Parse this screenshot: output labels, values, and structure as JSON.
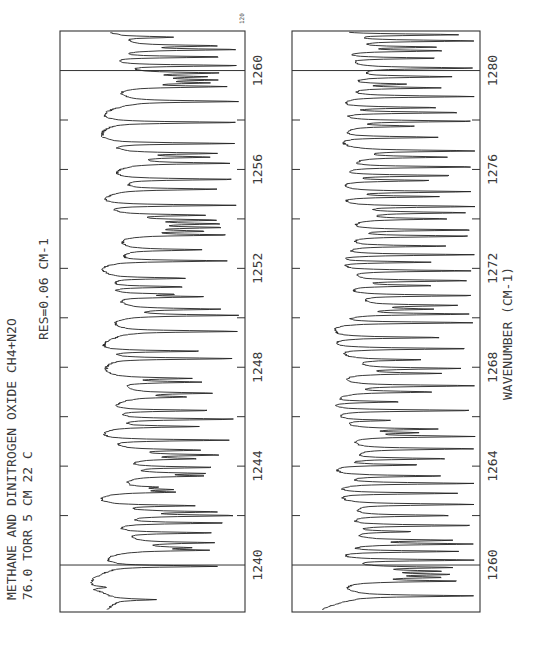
{
  "chart_data": {
    "type": "line",
    "orientation": "rotated-90-ccw",
    "title": "METHANE AND DINITROGEN OXIDE   CH4+N2O",
    "subtitle_lines": [
      "76.0  TORR   5 CM   22 C",
      "RES=0.06 CM-1"
    ],
    "top_right_label": "120",
    "xlabel": "WAVENUMBER (CM-1)",
    "ylabel": "Transmittance",
    "grid": false,
    "panels": [
      {
        "name": "panel-1",
        "xlim": [
          1238.1,
          1261.6
        ],
        "x_ticks": [
          1240,
          1244,
          1248,
          1252,
          1256,
          1260
        ],
        "minor_tick_step": 2,
        "full_lines_at": [
          1240,
          1260
        ],
        "baseline": 0.82,
        "lines": [
          [
            1238.6,
            0.55
          ],
          [
            1239.0,
            0.85
          ],
          [
            1239.1,
            0.75
          ],
          [
            1239.95,
            0.15
          ],
          [
            1240.6,
            0.25
          ],
          [
            1240.7,
            0.42
          ],
          [
            1240.9,
            0.22
          ],
          [
            1241.3,
            0.2
          ],
          [
            1241.7,
            0.1
          ],
          [
            1242.0,
            0.05
          ],
          [
            1242.15,
            0.18
          ],
          [
            1242.4,
            0.3
          ],
          [
            1242.95,
            0.45
          ],
          [
            1243.05,
            0.5
          ],
          [
            1243.15,
            0.6
          ],
          [
            1243.6,
            0.3
          ],
          [
            1243.7,
            0.28
          ],
          [
            1243.95,
            0.2
          ],
          [
            1244.3,
            0.35
          ],
          [
            1244.45,
            0.18
          ],
          [
            1244.65,
            0.3
          ],
          [
            1245.05,
            0.08
          ],
          [
            1245.6,
            0.28
          ],
          [
            1245.9,
            0.05
          ],
          [
            1246.25,
            0.2
          ],
          [
            1246.8,
            0.42
          ],
          [
            1246.95,
            0.22
          ],
          [
            1247.4,
            0.28
          ],
          [
            1247.55,
            0.34
          ],
          [
            1248.35,
            0.05
          ],
          [
            1248.65,
            0.24
          ],
          [
            1249.45,
            0.03
          ],
          [
            1250.1,
            0.03
          ],
          [
            1250.35,
            0.16
          ],
          [
            1250.85,
            0.25
          ],
          [
            1250.95,
            0.45
          ],
          [
            1251.25,
            0.35
          ],
          [
            1251.6,
            0.35
          ],
          [
            1252.3,
            0.1
          ],
          [
            1252.75,
            0.28
          ],
          [
            1253.35,
            0.1
          ],
          [
            1253.5,
            0.3
          ],
          [
            1253.65,
            0.16
          ],
          [
            1253.8,
            0.18
          ],
          [
            1253.95,
            0.2
          ],
          [
            1254.15,
            0.25
          ],
          [
            1254.55,
            0.04
          ],
          [
            1255.2,
            0.17
          ],
          [
            1255.6,
            0.05
          ],
          [
            1256.25,
            0.08
          ],
          [
            1256.5,
            0.25
          ],
          [
            1256.65,
            0.18
          ],
          [
            1257.05,
            0.05
          ],
          [
            1257.9,
            0.02
          ],
          [
            1258.75,
            0.02
          ],
          [
            1259.35,
            0.12
          ],
          [
            1259.5,
            0.28
          ],
          [
            1259.62,
            0.22
          ],
          [
            1259.75,
            0.3
          ],
          [
            1259.9,
            0.18
          ],
          [
            1260.2,
            0.02
          ],
          [
            1260.55,
            0.12
          ],
          [
            1260.85,
            0.03
          ],
          [
            1261.0,
            0.18
          ],
          [
            1261.35,
            0.45
          ]
        ]
      },
      {
        "name": "panel-2",
        "xlim": [
          1258.1,
          1281.6
        ],
        "x_ticks": [
          1260,
          1264,
          1268,
          1272,
          1276,
          1280
        ],
        "minor_tick_step": 2,
        "full_lines_at": [
          1260,
          1280
        ],
        "baseline": 0.86,
        "lines": [
          [
            1258.75,
            0.02
          ],
          [
            1259.35,
            0.12
          ],
          [
            1259.5,
            0.28
          ],
          [
            1259.62,
            0.22
          ],
          [
            1259.75,
            0.3
          ],
          [
            1259.9,
            0.18
          ],
          [
            1260.2,
            0.02
          ],
          [
            1260.55,
            0.12
          ],
          [
            1260.85,
            0.03
          ],
          [
            1261.0,
            0.18
          ],
          [
            1261.35,
            0.45
          ],
          [
            1261.6,
            0.02
          ],
          [
            1262.0,
            0.18
          ],
          [
            1262.45,
            0.02
          ],
          [
            1262.9,
            0.12
          ],
          [
            1263.3,
            0.02
          ],
          [
            1263.6,
            0.22
          ],
          [
            1264.05,
            0.35
          ],
          [
            1264.3,
            0.2
          ],
          [
            1264.7,
            0.02
          ],
          [
            1265.2,
            0.02
          ],
          [
            1265.35,
            0.45
          ],
          [
            1265.5,
            0.28
          ],
          [
            1265.85,
            0.55
          ],
          [
            1266.25,
            0.02
          ],
          [
            1266.6,
            0.45
          ],
          [
            1267.0,
            0.3
          ],
          [
            1267.25,
            0.02
          ],
          [
            1267.75,
            0.25
          ],
          [
            1267.95,
            0.12
          ],
          [
            1268.3,
            0.38
          ],
          [
            1268.75,
            0.04
          ],
          [
            1269.2,
            0.22
          ],
          [
            1269.8,
            0.03
          ],
          [
            1270.15,
            0.06
          ],
          [
            1270.35,
            0.35
          ],
          [
            1270.5,
            0.15
          ],
          [
            1270.9,
            0.02
          ],
          [
            1271.3,
            0.3
          ],
          [
            1271.5,
            0.06
          ],
          [
            1271.9,
            0.04
          ],
          [
            1272.25,
            0.28
          ],
          [
            1272.55,
            0.02
          ],
          [
            1272.9,
            0.2
          ],
          [
            1273.3,
            0.04
          ],
          [
            1273.55,
            0.02
          ],
          [
            1274.0,
            0.22
          ],
          [
            1274.25,
            0.09
          ],
          [
            1274.5,
            0.02
          ],
          [
            1274.9,
            0.25
          ],
          [
            1275.1,
            0.04
          ],
          [
            1275.55,
            0.3
          ],
          [
            1275.75,
            0.15
          ],
          [
            1276.1,
            0.02
          ],
          [
            1276.5,
            0.22
          ],
          [
            1276.75,
            0.02
          ],
          [
            1277.3,
            0.25
          ],
          [
            1277.75,
            0.42
          ],
          [
            1277.95,
            0.02
          ],
          [
            1278.3,
            0.1
          ],
          [
            1278.5,
            0.25
          ],
          [
            1278.95,
            0.02
          ],
          [
            1279.3,
            0.25
          ],
          [
            1279.45,
            0.5
          ],
          [
            1279.75,
            0.18
          ],
          [
            1280.1,
            0.02
          ],
          [
            1280.5,
            0.25
          ],
          [
            1280.8,
            0.22
          ],
          [
            1280.95,
            0.28
          ],
          [
            1281.2,
            0.02
          ],
          [
            1281.45,
            0.12
          ]
        ]
      }
    ]
  }
}
